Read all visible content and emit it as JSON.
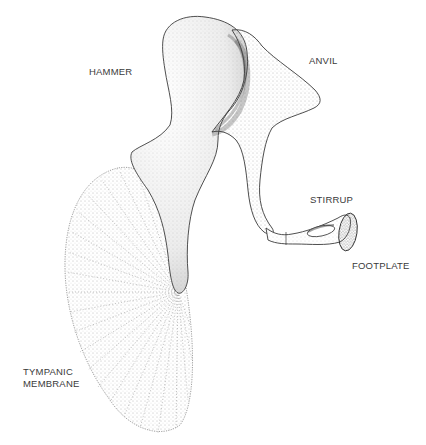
{
  "diagram": {
    "labels": {
      "hammer": "HAMMER",
      "anvil": "ANVIL",
      "stirrup": "STIRRUP",
      "footplate": "FOOTPLATE",
      "tympanic_line1": "TYMPANIC",
      "tympanic_line2": "MEMBRANE"
    },
    "colors": {
      "background": "#ffffff",
      "ink": "#2a2a2a",
      "stipple": "#6a6a6a",
      "label": "#3a3a3a"
    }
  }
}
